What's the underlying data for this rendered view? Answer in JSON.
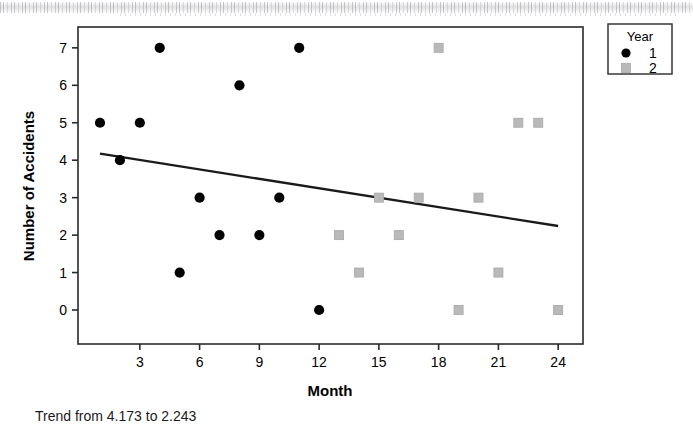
{
  "caption": "Trend from 4.173 to 2.243",
  "legend": {
    "title": "Year",
    "items": [
      {
        "label": "1",
        "marker": "circle",
        "color": "#000000"
      },
      {
        "label": "2",
        "marker": "square",
        "color": "#b9b9b9"
      }
    ]
  },
  "chart_data": {
    "type": "scatter",
    "title": "",
    "xlabel": "Month",
    "ylabel": "Number of Accidents",
    "xlim": [
      0,
      25
    ],
    "ylim": [
      -0.45,
      7.6
    ],
    "xticks": [
      3,
      6,
      9,
      12,
      15,
      18,
      21,
      24
    ],
    "yticks": [
      0,
      1,
      2,
      3,
      4,
      5,
      6,
      7
    ],
    "grid": false,
    "legend_position": "top-right-outside",
    "series": [
      {
        "name": "1",
        "marker": "circle",
        "color": "#000000",
        "points": [
          {
            "x": 1,
            "y": 5
          },
          {
            "x": 2,
            "y": 4
          },
          {
            "x": 3,
            "y": 5
          },
          {
            "x": 4,
            "y": 7
          },
          {
            "x": 5,
            "y": 1
          },
          {
            "x": 6,
            "y": 3
          },
          {
            "x": 7,
            "y": 2
          },
          {
            "x": 8,
            "y": 6
          },
          {
            "x": 9,
            "y": 2
          },
          {
            "x": 10,
            "y": 3
          },
          {
            "x": 11,
            "y": 7
          },
          {
            "x": 12,
            "y": 0
          }
        ]
      },
      {
        "name": "2",
        "marker": "square",
        "color": "#b9b9b9",
        "points": [
          {
            "x": 13,
            "y": 2
          },
          {
            "x": 14,
            "y": 1
          },
          {
            "x": 15,
            "y": 3
          },
          {
            "x": 16,
            "y": 2
          },
          {
            "x": 17,
            "y": 3
          },
          {
            "x": 18,
            "y": 7
          },
          {
            "x": 19,
            "y": 0
          },
          {
            "x": 20,
            "y": 3
          },
          {
            "x": 21,
            "y": 1
          },
          {
            "x": 22,
            "y": 5
          },
          {
            "x": 23,
            "y": 5
          },
          {
            "x": 24,
            "y": 0
          }
        ]
      }
    ],
    "trendline": {
      "label": "Trend from 4.173 to 2.243",
      "x_start": 1,
      "y_start": 4.173,
      "x_end": 24,
      "y_end": 2.243,
      "color": "#1a1a1a"
    }
  }
}
